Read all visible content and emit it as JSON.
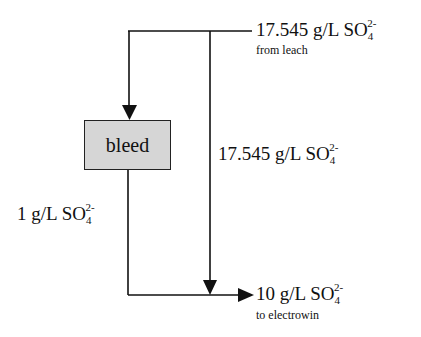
{
  "diagram": {
    "type": "flow",
    "nodes": [
      {
        "id": "bleed",
        "label": "bleed",
        "fill": "#d6d6d6"
      }
    ],
    "streams": {
      "feed": {
        "value": "17.545 g/L SO",
        "sub": "4",
        "sup": "2-",
        "note": "from leach"
      },
      "bypass": {
        "value": "17.545 g/L SO",
        "sub": "4",
        "sup": "2-"
      },
      "bleed_out": {
        "value": "1 g/L SO",
        "sub": "4",
        "sup": "2-"
      },
      "product": {
        "value": "10 g/L SO",
        "sub": "4",
        "sup": "2-",
        "note": "to electrowin"
      }
    },
    "edges": [
      {
        "from": "leach",
        "to": "bleed",
        "label": "17.545 g/L SO4 2-"
      },
      {
        "from": "leach",
        "to": "electrowin",
        "label": "17.545 g/L SO4 2- (bypass)"
      },
      {
        "from": "bleed",
        "to": "electrowin",
        "label": "1 g/L SO4 2-"
      }
    ],
    "colors": {
      "line": "#111111",
      "box_fill": "#d6d6d6"
    }
  }
}
